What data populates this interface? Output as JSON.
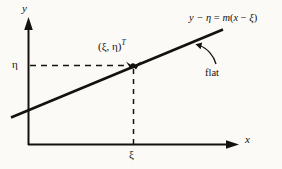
{
  "figure": {
    "type": "line-diagram",
    "background_color": "#fbfaf7",
    "ink_color": "#14110f",
    "axes": {
      "x_label": "x",
      "y_label": "y",
      "origin_px": [
        28,
        145
      ],
      "x_axis_end_px": [
        238,
        145
      ],
      "y_axis_top_px": [
        28,
        18
      ]
    },
    "ticks": {
      "y_tick_label": "η",
      "x_tick_label": "ξ"
    },
    "point": {
      "label_open": "(",
      "label_xi": "ξ",
      "label_comma": ", ",
      "label_eta": "η",
      "label_close": ")",
      "label_sup": "T",
      "position_px": [
        133,
        65
      ]
    },
    "line": {
      "equation_lhs": "y − η",
      "equation_eq": " = ",
      "equation_rhs_m": "m",
      "equation_rhs_open": "(",
      "equation_rhs_x": "x",
      "equation_rhs_minus": " − ",
      "equation_rhs_xi": "ξ",
      "equation_rhs_close": ")",
      "start_px": [
        12,
        117
      ],
      "end_px": [
        222,
        30
      ],
      "slope_m": 0.414
    },
    "annotation": {
      "text": "flat",
      "arrow_tail_px": [
        216,
        64
      ],
      "arrow_head_px": [
        196,
        45
      ]
    },
    "dashed_guides": {
      "horizontal_from_px": [
        29,
        65
      ],
      "horizontal_to_px": [
        133,
        65
      ],
      "vertical_from_px": [
        133,
        68
      ],
      "vertical_to_px": [
        133,
        145
      ]
    }
  }
}
